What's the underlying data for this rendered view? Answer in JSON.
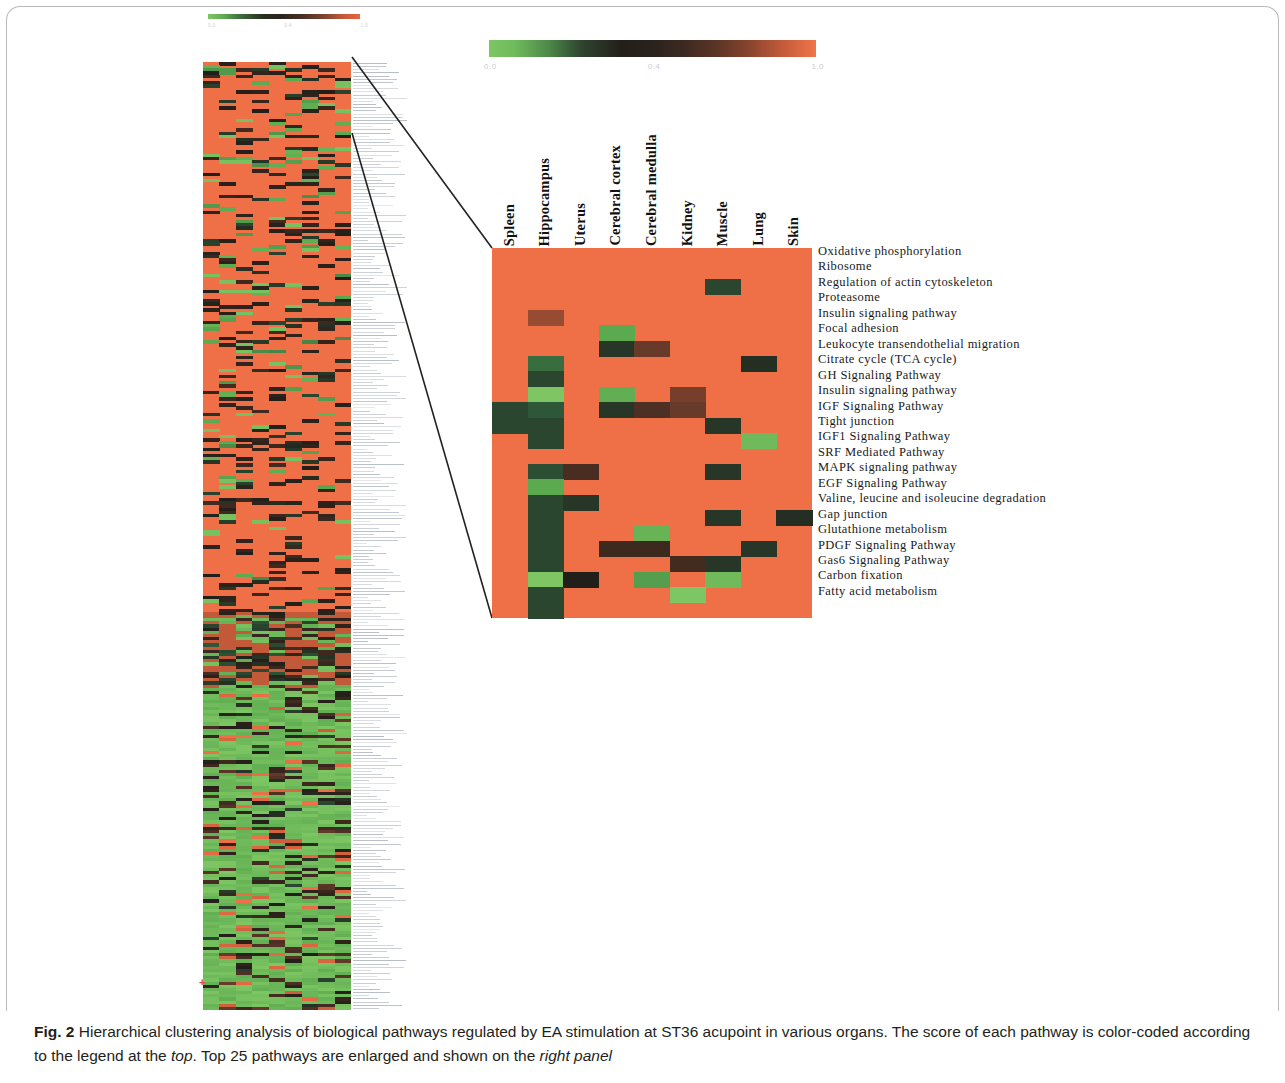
{
  "figure": {
    "caption_number": "Fig. 2",
    "caption_text": " Hierarchical clustering analysis of biological pathways regulated by EA stimulation at ST36 acupoint in various organs. The score of each pathway is color-coded according to the legend at the ",
    "caption_italic_1": "top",
    "caption_middle": ". Top 25 pathways are enlarged and shown on the ",
    "caption_italic_2": "right panel"
  },
  "legend": {
    "ticks": [
      "0.0",
      "0.4",
      "1.0"
    ],
    "min_color": "#7ec663",
    "mid_color": "#241f1a",
    "max_color": "#ef7448"
  },
  "overview": {
    "ticks": [
      "0.0",
      "0.4",
      "1.0"
    ]
  },
  "colors": {
    "background_cell": "#ef7047",
    "green_high": "#7ec663",
    "green_dark": "#2f4b33",
    "brown_dark": "#4a2e22",
    "brown_mid": "#6b4434",
    "brown_light": "#a8644b",
    "black": "#1b1410",
    "panel_border": "#b9b9b9"
  },
  "chart_data": {
    "type": "heatmap",
    "title": "Hierarchical clustering analysis of biological pathways regulated by EA stimulation at ST36 acupoint in various organs",
    "xlabel": "",
    "ylabel": "",
    "colorbar_label": "",
    "zlim": [
      0.0,
      1.0
    ],
    "colorbar_ticks": [
      0.0,
      0.4,
      1.0
    ],
    "legend_position": "top",
    "grid": false,
    "columns": [
      "Spleen",
      "Hippocampus",
      "Uterus",
      "Cerebral cortex",
      "Cerebral medulla",
      "Kidney",
      "Muscle",
      "Lung",
      "Skin"
    ],
    "rows": [
      "Oxidative phosphorylation",
      "Ribosome",
      "Regulation of actin cytoskeleton",
      "Proteasome",
      "Insulin signaling pathway",
      "Focal adhesion",
      "Leukocyte transendothelial migration",
      "Citrate cycle (TCA cycle)",
      "GH Signaling Pathway",
      "Insulin signaling pathway",
      "IGF Signaling Pathway",
      "Tight junction",
      "IGF1 Signaling Pathway",
      "SRF Mediated Pathway",
      "MAPK signaling pathway",
      "EGF Signaling Pathway",
      "Valine, leucine and isoleucine degradation",
      "Gap junction",
      "Glutathione metabolism",
      "PDGF Signaling Pathway",
      "Gas6 Signaling Pathway",
      "Carbon fixation",
      "Fatty acid metabolism"
    ],
    "values": [
      [
        1.0,
        1.0,
        1.0,
        1.0,
        1.0,
        1.0,
        1.0,
        1.0,
        1.0
      ],
      [
        1.0,
        1.0,
        1.0,
        1.0,
        1.0,
        1.0,
        1.0,
        1.0,
        1.0
      ],
      [
        1.0,
        1.0,
        1.0,
        1.0,
        1.0,
        1.0,
        0.3,
        1.0,
        1.0
      ],
      [
        1.0,
        1.0,
        1.0,
        1.0,
        1.0,
        1.0,
        1.0,
        1.0,
        1.0
      ],
      [
        1.0,
        0.82,
        1.0,
        1.0,
        1.0,
        1.0,
        1.0,
        1.0,
        1.0
      ],
      [
        1.0,
        1.0,
        1.0,
        0.12,
        1.0,
        1.0,
        1.0,
        1.0,
        1.0
      ],
      [
        1.0,
        1.0,
        1.0,
        0.34,
        0.7,
        1.0,
        1.0,
        1.0,
        1.0
      ],
      [
        1.0,
        0.22,
        1.0,
        1.0,
        1.0,
        1.0,
        1.0,
        0.36,
        1.0
      ],
      [
        1.0,
        0.3,
        1.0,
        1.0,
        1.0,
        1.0,
        1.0,
        1.0,
        1.0
      ],
      [
        1.0,
        0.0,
        1.0,
        0.1,
        1.0,
        0.74,
        1.0,
        1.0,
        1.0
      ],
      [
        0.3,
        0.26,
        1.0,
        0.34,
        0.62,
        0.7,
        1.0,
        1.0,
        1.0
      ],
      [
        0.3,
        0.3,
        1.0,
        1.0,
        1.0,
        1.0,
        0.34,
        1.0,
        1.0
      ],
      [
        1.0,
        0.3,
        1.0,
        1.0,
        1.0,
        1.0,
        1.0,
        0.05,
        1.0
      ],
      [
        1.0,
        1.0,
        1.0,
        1.0,
        1.0,
        1.0,
        1.0,
        1.0,
        1.0
      ],
      [
        1.0,
        0.28,
        0.6,
        1.0,
        1.0,
        1.0,
        0.34,
        1.0,
        1.0
      ],
      [
        1.0,
        0.12,
        1.0,
        1.0,
        1.0,
        1.0,
        1.0,
        1.0,
        1.0
      ],
      [
        1.0,
        0.3,
        0.34,
        1.0,
        1.0,
        1.0,
        1.0,
        1.0,
        1.0
      ],
      [
        1.0,
        0.3,
        1.0,
        1.0,
        1.0,
        1.0,
        0.34,
        1.0,
        0.36
      ],
      [
        1.0,
        0.3,
        1.0,
        1.0,
        0.08,
        1.0,
        1.0,
        1.0,
        1.0
      ],
      [
        1.0,
        0.3,
        1.0,
        0.56,
        0.56,
        1.0,
        1.0,
        0.34,
        1.0
      ],
      [
        1.0,
        0.3,
        1.0,
        1.0,
        1.0,
        0.58,
        0.34,
        1.0,
        1.0
      ],
      [
        1.0,
        0.0,
        0.4,
        1.0,
        0.14,
        1.0,
        0.05,
        1.0,
        1.0
      ],
      [
        1.0,
        0.3,
        1.0,
        1.0,
        1.0,
        0.0,
        1.0,
        1.0,
        1.0
      ],
      [
        1.0,
        0.3,
        1.0,
        1.0,
        1.0,
        1.0,
        1.0,
        1.0,
        1.0
      ]
    ],
    "note": "Values are normalized scores 0.0-1.0 read from the color legend; 1.00 = background orange (no/low regulation), 0.00 = bright green (maximum)."
  }
}
